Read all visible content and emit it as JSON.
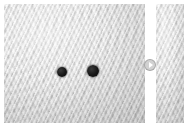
{
  "viewer": {
    "name": "image-comparison-viewer",
    "background_color": "#ffffff",
    "width": 184,
    "height": 131
  },
  "panels": [
    {
      "id": "left",
      "label": "",
      "role": "primary-image-panel",
      "base_color": "#d2d2d2",
      "texture": "mottled-diagonal-ripple-grayscale",
      "x": 4,
      "y": 4,
      "width": 141,
      "height": 119
    },
    {
      "id": "right",
      "label": "",
      "role": "secondary-image-panel",
      "base_color": "#d2d2d2",
      "texture": "mottled-diagonal-ripple-grayscale",
      "x": 156,
      "y": 4,
      "width": 28,
      "height": 119
    }
  ],
  "markers": [
    {
      "id": "dot-1",
      "label": "",
      "color": "#121212",
      "x": 58,
      "y": 68,
      "diameter": 10
    },
    {
      "id": "dot-2",
      "label": "",
      "color": "#121212",
      "x": 89,
      "y": 67,
      "diameter": 12
    }
  ],
  "controls": {
    "next": {
      "icon": "play-triangle-right-icon",
      "label": "",
      "fill_color": "#cdcdcd",
      "glyph_color": "#ffffff",
      "x": 150,
      "y": 65,
      "diameter": 12
    }
  }
}
